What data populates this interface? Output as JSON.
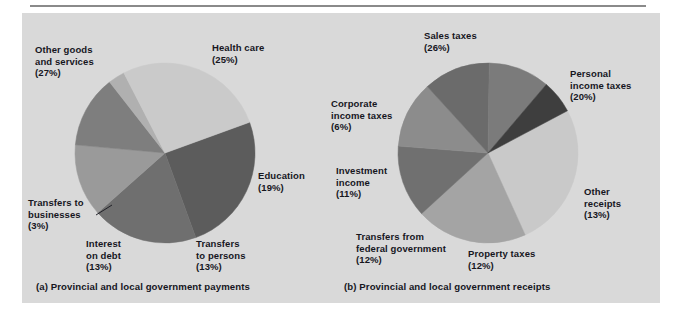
{
  "figure": {
    "background_color": "#d9d9d9",
    "page_color": "#ffffff",
    "rule_color": "#8a8a8a",
    "text_color": "#16161e"
  },
  "captions": {
    "left": "(a) Provincial and local government payments",
    "right": "(b) Provincial and local government receipts"
  },
  "chart_data": [
    {
      "type": "pie",
      "title": "(a) Provincial and local government payments",
      "legend_position": "callout-labels",
      "total_percent": 100,
      "start_angle_deg": -20,
      "categories": [
        "Health care",
        "Education",
        "Transfers to persons",
        "Interest on debt",
        "Transfers to businesses",
        "Other goods and services"
      ],
      "values": [
        25,
        19,
        13,
        13,
        3,
        27
      ],
      "labels": [
        "Health care\n(25%)",
        "Education\n(19%)",
        "Transfers\nto persons\n(13%)",
        "Interest\non debt\n(13%)",
        "Transfers to\nbusinesses\n(3%)",
        "Other goods\nand services\n(27%)"
      ],
      "colors": [
        "#5c5c5c",
        "#6f6f6f",
        "#9a9a9a",
        "#7e7e7e",
        "#b0b0b0",
        "#cacaca"
      ],
      "center": [
        165,
        153
      ],
      "radius": 90
    },
    {
      "type": "pie",
      "title": "(b) Provincial and local government receipts",
      "legend_position": "callout-labels",
      "total_percent": 100,
      "start_angle_deg": -28,
      "categories": [
        "Sales taxes",
        "Personal income taxes",
        "Other receipts",
        "Property taxes",
        "Transfers from federal government",
        "Investment income",
        "Corporate income taxes"
      ],
      "values": [
        26,
        20,
        13,
        12,
        12,
        11,
        6
      ],
      "labels": [
        "Sales taxes\n(26%)",
        "Personal\nincome taxes\n(20%)",
        "Other\nreceipts\n(13%)",
        "Property taxes\n(12%)",
        "Transfers from\nfederal government\n(12%)",
        "Investment\nincome\n(11%)",
        "Corporate\nincome taxes\n(6%)"
      ],
      "colors": [
        "#c9c9c9",
        "#a4a4a4",
        "#707070",
        "#8c8c8c",
        "#6b6b6b",
        "#7b7b7b",
        "#3e3e3e"
      ],
      "center": [
        488,
        153
      ],
      "radius": 90
    }
  ],
  "labels_left": {
    "other_goods": "Other goods\nand services\n(27%)",
    "health_care": "Health care\n(25%)",
    "education": "Education\n(19%)",
    "transfers_persons": "Transfers\nto persons\n(13%)",
    "interest_debt": "Interest\non debt\n(13%)",
    "transfers_business": "Transfers to\nbusinesses\n(3%)"
  },
  "labels_right": {
    "sales_taxes": "Sales taxes\n(26%)",
    "personal_income": "Personal\nincome taxes\n(20%)",
    "other_receipts": "Other\nreceipts\n(13%)",
    "property_taxes": "Property taxes\n(12%)",
    "transfers_federal": "Transfers from\nfederal government\n(12%)",
    "investment_income": "Investment\nincome\n(11%)",
    "corporate_income": "Corporate\nincome taxes\n(6%)"
  }
}
